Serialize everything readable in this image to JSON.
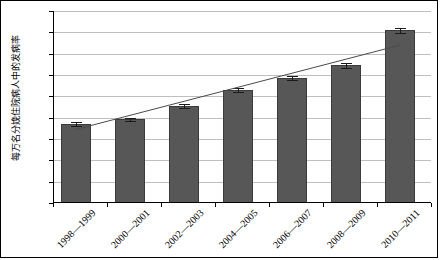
{
  "chart_data": {
    "type": "bar",
    "title": "",
    "subtitle": "",
    "xlabel": "",
    "ylabel": "每万名分娩住院病人中的发病率",
    "categories": [
      "1998—1999",
      "2000—2001",
      "2002—2003",
      "2004—2005",
      "2006—2007",
      "2008—2009",
      "2010—2011"
    ],
    "values": [
      74.0,
      78.5,
      91.0,
      106.0,
      117.5,
      129.0,
      162.0
    ],
    "errors": [
      1.5,
      1.5,
      2.0,
      2.0,
      2.0,
      2.0,
      2.5
    ],
    "series": [
      {
        "name": "发病率",
        "values": [
          74.0,
          78.5,
          91.0,
          106.0,
          117.5,
          129.0,
          162.0
        ]
      },
      {
        "name": "趋势线",
        "type": "line",
        "values": [
          69.0,
          82.2,
          95.3,
          108.5,
          121.7,
          134.8,
          148.0
        ]
      }
    ],
    "ylim": [
      0,
      180
    ],
    "xlim_categories": 7,
    "ytick_values": [
      0.0,
      20.0,
      40.0,
      60.0,
      80.0,
      100.0,
      120.0,
      140.0,
      160.0,
      180.0
    ],
    "ytick_labels": [
      "0.0",
      "20.0",
      "40.0",
      "60.0",
      "80.0",
      "100.0",
      "120.0",
      "140.0",
      "160.0",
      "180.0"
    ],
    "grid": "horizontal",
    "legend": "none",
    "colors": {
      "bar_fill": "#575757",
      "bar_stroke": "#3b3b3b",
      "gridline": "#bfbfbf",
      "axis": "#000000",
      "trendline": "#4a4a4a",
      "errorbar": "#1a1a1a",
      "background": "#ffffff",
      "frame": "#000000"
    },
    "trendline": {
      "start_value": 69.0,
      "end_value": 148.0,
      "visible": true
    }
  }
}
